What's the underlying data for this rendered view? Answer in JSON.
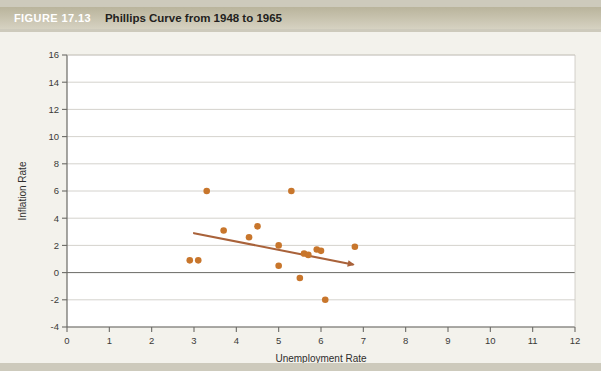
{
  "figure": {
    "tag": "FIGURE 17.13",
    "title": "Phillips Curve from 1948 to 1965"
  },
  "colors": {
    "header_bar": "#c2bda6",
    "tag_text": "#ffffff",
    "title_text": "#231f20",
    "page_bg": "#cdcabc",
    "chart_bg": "#f3f2ec",
    "plot_bg": "#ffffff",
    "point": "#c8762c",
    "trendline": "#a9623a",
    "gridline": "#c9c7c0",
    "axis": "#6b6a66",
    "zero_line": "#6b6a66"
  },
  "chart_data": {
    "type": "scatter",
    "title": "Phillips Curve from 1948 to 1965",
    "xlabel": "Unemployment Rate",
    "ylabel": "Inflation Rate",
    "xlim": [
      0,
      12
    ],
    "ylim": [
      -4,
      16
    ],
    "xticks": [
      0,
      1,
      2,
      3,
      4,
      5,
      6,
      7,
      8,
      9,
      10,
      11,
      12
    ],
    "yticks": [
      -4,
      -2,
      0,
      2,
      4,
      6,
      8,
      10,
      12,
      14,
      16
    ],
    "xtick_labels": [
      "0",
      "1",
      "2",
      "3",
      "4",
      "5",
      "6",
      "7",
      "8",
      "9",
      "10",
      "11",
      "12"
    ],
    "ytick_labels": [
      "-4",
      "-2",
      "0",
      "2",
      "4",
      "6",
      "8",
      "10",
      "12",
      "14",
      "16"
    ],
    "grid": "horizontal",
    "legend": "none",
    "series": [
      {
        "name": "Inflation vs Unemployment",
        "marker": "circle",
        "color": "#c8762c",
        "points": [
          {
            "x": 2.9,
            "y": 0.9
          },
          {
            "x": 3.1,
            "y": 0.9
          },
          {
            "x": 3.3,
            "y": 6.0
          },
          {
            "x": 3.7,
            "y": 3.1
          },
          {
            "x": 4.3,
            "y": 2.6
          },
          {
            "x": 4.5,
            "y": 3.4
          },
          {
            "x": 5.0,
            "y": 2.0
          },
          {
            "x": 5.0,
            "y": 0.5
          },
          {
            "x": 5.3,
            "y": 6.0
          },
          {
            "x": 5.5,
            "y": -0.4
          },
          {
            "x": 5.6,
            "y": 1.4
          },
          {
            "x": 5.7,
            "y": 1.3
          },
          {
            "x": 5.9,
            "y": 1.7
          },
          {
            "x": 6.0,
            "y": 1.6
          },
          {
            "x": 6.1,
            "y": -2.0
          },
          {
            "x": 6.8,
            "y": 1.9
          }
        ]
      }
    ],
    "trendline": {
      "name": "fitted Phillips curve",
      "color": "#a9623a",
      "arrow_end": true,
      "start": {
        "x": 3.0,
        "y": 2.9
      },
      "end": {
        "x": 6.75,
        "y": 0.6
      }
    }
  }
}
